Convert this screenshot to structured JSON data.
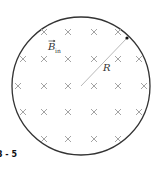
{
  "diagram": {
    "figure_label": "3 - 5",
    "field_label": {
      "main": "B",
      "subscript": "in",
      "has_vector_arrow": true
    },
    "radius_label": "R",
    "field_direction": "into-page",
    "field_marker_symbol": "×",
    "marker_rows": [
      4,
      6,
      6,
      6,
      4
    ],
    "colors": {
      "circle": "#333333",
      "markers": "#9a9a9a",
      "radius_line": "#b0b0b0",
      "labels": "#333333"
    }
  }
}
